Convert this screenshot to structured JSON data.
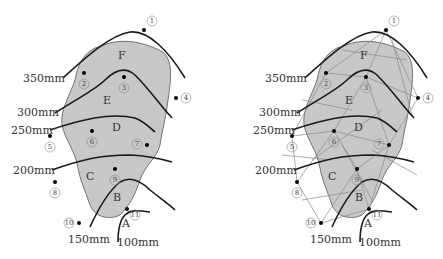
{
  "colors": {
    "region_fill": "#c8c8c8",
    "region_stroke": "#555555",
    "isohyet": "#1a1a1a",
    "thiessen": "#8a8a8a"
  },
  "isohyet_labels": [
    "350mm",
    "300mm",
    "250mm",
    "200mm",
    "150mm",
    "100mm"
  ],
  "zones": [
    "F",
    "E",
    "D",
    "C",
    "B",
    "A"
  ],
  "stations": [
    "1",
    "2",
    "3",
    "4",
    "5",
    "6",
    "7",
    "8",
    "9",
    "10",
    "11"
  ],
  "panels": [
    {
      "name": "isohyetal-method"
    },
    {
      "name": "combined-thiessen-isohyetal"
    }
  ]
}
